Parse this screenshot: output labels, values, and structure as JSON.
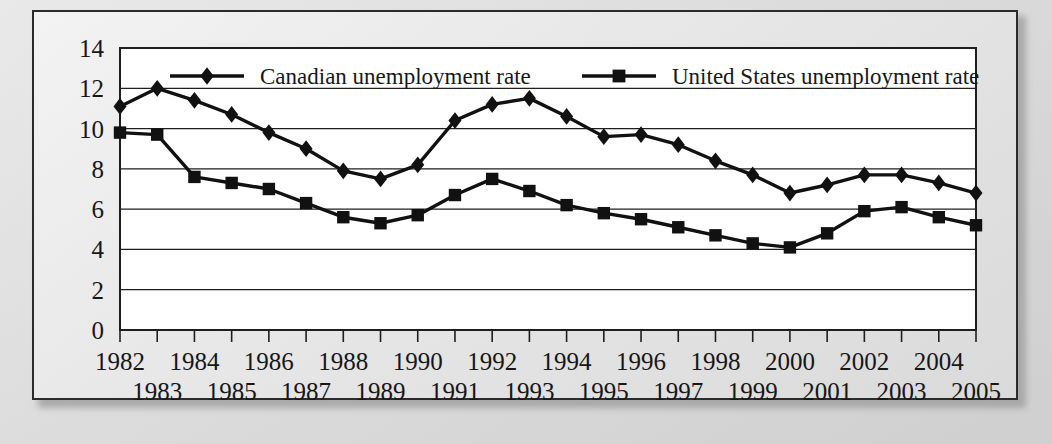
{
  "figure": {
    "frame_color": "#2b2b2b",
    "background": "#e8e8e8",
    "plot_background": "#ffffff"
  },
  "chart_data": {
    "type": "line",
    "title": "",
    "xlabel": "",
    "ylabel": "",
    "ylim": [
      0,
      14
    ],
    "ytick_step": 2,
    "yticks": [
      "0",
      "2",
      "4",
      "6",
      "8",
      "10",
      "12",
      "14"
    ],
    "grid": true,
    "grid_axis": "y",
    "legend_position": "top-inside",
    "categories": [
      "1982",
      "1983",
      "1984",
      "1985",
      "1986",
      "1987",
      "1988",
      "1989",
      "1990",
      "1991",
      "1992",
      "1993",
      "1994",
      "1995",
      "1996",
      "1997",
      "1998",
      "1999",
      "2000",
      "2001",
      "2002",
      "2003",
      "2004",
      "2005"
    ],
    "xtick_rows": {
      "top": [
        "1982",
        "1984",
        "1986",
        "1988",
        "1990",
        "1992",
        "1994",
        "1996",
        "1998",
        "2000",
        "2002",
        "2004"
      ],
      "bottom": [
        "1983",
        "1985",
        "1987",
        "1989",
        "1991",
        "1993",
        "1995",
        "1997",
        "1999",
        "2001",
        "2003",
        "2005"
      ]
    },
    "series": [
      {
        "name": "Canadian unemployment rate",
        "marker": "diamond",
        "color": "#111111",
        "values": [
          11.1,
          12.0,
          11.4,
          10.7,
          9.8,
          9.0,
          7.9,
          7.5,
          8.2,
          10.4,
          11.2,
          11.5,
          10.6,
          9.6,
          9.7,
          9.2,
          8.4,
          7.7,
          6.8,
          7.2,
          7.7,
          7.7,
          7.3,
          6.8
        ]
      },
      {
        "name": "United States unemployment rate",
        "marker": "square",
        "color": "#111111",
        "values": [
          9.8,
          9.7,
          7.6,
          7.3,
          7.0,
          6.3,
          5.6,
          5.3,
          5.7,
          6.7,
          7.5,
          6.9,
          6.2,
          5.8,
          5.5,
          5.1,
          4.7,
          4.3,
          4.1,
          4.8,
          5.9,
          6.1,
          5.6,
          5.2
        ]
      }
    ]
  },
  "legend": {
    "items": [
      {
        "label": "Canadian unemployment rate",
        "marker": "diamond"
      },
      {
        "label": "United States unemployment rate",
        "marker": "square"
      }
    ]
  }
}
